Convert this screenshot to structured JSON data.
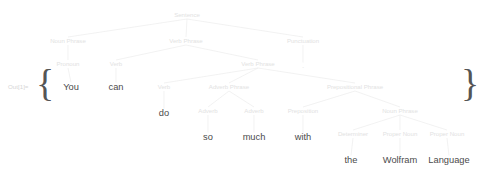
{
  "output_prompt": {
    "label": "Out[1]=",
    "x": 8,
    "y": 87
  },
  "braces": {
    "open": "{",
    "close": "}",
    "open_x": 45,
    "close_x": 470,
    "y": 87
  },
  "colors": {
    "background": "#ffffff",
    "node_text": "#e2e2e2",
    "leaf_text": "#4b4b4b",
    "edge": "#ececec",
    "prompt_text": "#d6d6d6",
    "brace": "#555555"
  },
  "tree": {
    "type": "syntax-tree",
    "sentence": "You can do so much with the Wolfram Language.",
    "nodes": [
      {
        "id": "sentence",
        "label": "Sentence",
        "x": 187,
        "y": 15,
        "kind": "category",
        "depth": 0
      },
      {
        "id": "np1",
        "label": "Noun Phrase",
        "x": 68,
        "y": 41,
        "kind": "category",
        "depth": 1
      },
      {
        "id": "vp1",
        "label": "Verb Phrase",
        "x": 186,
        "y": 41,
        "kind": "category",
        "depth": 1
      },
      {
        "id": "punctuation",
        "label": "Punctuation",
        "x": 303,
        "y": 41,
        "kind": "category",
        "depth": 1
      },
      {
        "id": "pronoun",
        "label": "Pronoun",
        "x": 68,
        "y": 64,
        "kind": "category",
        "depth": 2
      },
      {
        "id": "verb1",
        "label": "Verb",
        "x": 116,
        "y": 64,
        "kind": "category",
        "depth": 2
      },
      {
        "id": "vp2",
        "label": "Verb Phrase",
        "x": 258,
        "y": 64,
        "kind": "category",
        "depth": 2
      },
      {
        "id": "period",
        "label": ".",
        "x": 303,
        "y": 66,
        "kind": "leaf-punct",
        "depth": 2
      },
      {
        "id": "leaf-you",
        "label": "You",
        "x": 71,
        "y": 88,
        "kind": "leaf",
        "depth": 3
      },
      {
        "id": "leaf-can",
        "label": "can",
        "x": 116,
        "y": 88,
        "kind": "leaf",
        "depth": 3
      },
      {
        "id": "verb2",
        "label": "Verb",
        "x": 164,
        "y": 87,
        "kind": "category",
        "depth": 3
      },
      {
        "id": "advp",
        "label": "Adverb Phrase",
        "x": 229,
        "y": 87,
        "kind": "category",
        "depth": 3
      },
      {
        "id": "pp",
        "label": "Prepositional Phrase",
        "x": 355,
        "y": 87,
        "kind": "category",
        "depth": 3
      },
      {
        "id": "leaf-do",
        "label": "do",
        "x": 164,
        "y": 114,
        "kind": "leaf",
        "depth": 4
      },
      {
        "id": "adverb1",
        "label": "Adverb",
        "x": 208,
        "y": 111,
        "kind": "category",
        "depth": 4
      },
      {
        "id": "adverb2",
        "label": "Adverb",
        "x": 254,
        "y": 111,
        "kind": "category",
        "depth": 4
      },
      {
        "id": "preposition",
        "label": "Preposition",
        "x": 303,
        "y": 111,
        "kind": "category",
        "depth": 4
      },
      {
        "id": "np2",
        "label": "Noun Phrase",
        "x": 400,
        "y": 111,
        "kind": "category",
        "depth": 4
      },
      {
        "id": "leaf-so",
        "label": "so",
        "x": 208,
        "y": 138,
        "kind": "leaf",
        "depth": 5
      },
      {
        "id": "leaf-much",
        "label": "much",
        "x": 254,
        "y": 138,
        "kind": "leaf",
        "depth": 5
      },
      {
        "id": "leaf-with",
        "label": "with",
        "x": 303,
        "y": 138,
        "kind": "leaf",
        "depth": 5
      },
      {
        "id": "determiner",
        "label": "Determiner",
        "x": 353,
        "y": 134,
        "kind": "category",
        "depth": 5
      },
      {
        "id": "propernoun1",
        "label": "Proper Noun",
        "x": 400,
        "y": 134,
        "kind": "category",
        "depth": 5
      },
      {
        "id": "propernoun2",
        "label": "Proper Noun",
        "x": 447,
        "y": 134,
        "kind": "category",
        "depth": 5
      },
      {
        "id": "leaf-the",
        "label": "the",
        "x": 351,
        "y": 161,
        "kind": "leaf",
        "depth": 6
      },
      {
        "id": "leaf-wolfram",
        "label": "Wolfram",
        "x": 400,
        "y": 161,
        "kind": "leaf",
        "depth": 6
      },
      {
        "id": "leaf-language",
        "label": "Language",
        "x": 449,
        "y": 161,
        "kind": "leaf",
        "depth": 6
      }
    ],
    "edges": [
      {
        "from": "sentence",
        "to": "np1"
      },
      {
        "from": "sentence",
        "to": "vp1"
      },
      {
        "from": "sentence",
        "to": "punctuation"
      },
      {
        "from": "np1",
        "to": "pronoun"
      },
      {
        "from": "vp1",
        "to": "verb1"
      },
      {
        "from": "vp1",
        "to": "vp2"
      },
      {
        "from": "punctuation",
        "to": "period"
      },
      {
        "from": "pronoun",
        "to": "leaf-you"
      },
      {
        "from": "verb1",
        "to": "leaf-can"
      },
      {
        "from": "vp2",
        "to": "verb2"
      },
      {
        "from": "vp2",
        "to": "advp"
      },
      {
        "from": "vp2",
        "to": "pp"
      },
      {
        "from": "verb2",
        "to": "leaf-do"
      },
      {
        "from": "advp",
        "to": "adverb1"
      },
      {
        "from": "advp",
        "to": "adverb2"
      },
      {
        "from": "pp",
        "to": "preposition"
      },
      {
        "from": "pp",
        "to": "np2"
      },
      {
        "from": "adverb1",
        "to": "leaf-so"
      },
      {
        "from": "adverb2",
        "to": "leaf-much"
      },
      {
        "from": "preposition",
        "to": "leaf-with"
      },
      {
        "from": "np2",
        "to": "determiner"
      },
      {
        "from": "np2",
        "to": "propernoun1"
      },
      {
        "from": "np2",
        "to": "propernoun2"
      },
      {
        "from": "determiner",
        "to": "leaf-the"
      },
      {
        "from": "propernoun1",
        "to": "leaf-wolfram"
      },
      {
        "from": "propernoun2",
        "to": "leaf-language"
      }
    ]
  }
}
